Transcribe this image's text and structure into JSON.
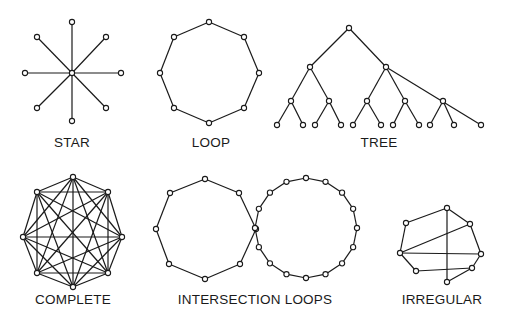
{
  "colors": {
    "ink": "#1a1a1a",
    "background": "#ffffff"
  },
  "diagrams": [
    {
      "key": "star",
      "label": "STAR",
      "label_pos": [
        72,
        135
      ],
      "nodes": [
        [
          72,
          73
        ],
        [
          72,
          22
        ],
        [
          106,
          37
        ],
        [
          121,
          73
        ],
        [
          106,
          108
        ],
        [
          72,
          121
        ],
        [
          37,
          108
        ],
        [
          25,
          73
        ],
        [
          37,
          37
        ]
      ],
      "edges": [
        [
          0,
          1
        ],
        [
          0,
          2
        ],
        [
          0,
          3
        ],
        [
          0,
          4
        ],
        [
          0,
          5
        ],
        [
          0,
          6
        ],
        [
          0,
          7
        ],
        [
          0,
          8
        ]
      ]
    },
    {
      "key": "loop",
      "label": "LOOP",
      "label_pos": [
        211,
        135
      ],
      "nodes": [
        [
          209,
          22
        ],
        [
          244,
          37
        ],
        [
          259,
          73
        ],
        [
          244,
          108
        ],
        [
          209,
          123
        ],
        [
          174,
          108
        ],
        [
          160,
          73
        ],
        [
          174,
          37
        ]
      ],
      "edges": [
        [
          0,
          1
        ],
        [
          1,
          2
        ],
        [
          2,
          3
        ],
        [
          3,
          4
        ],
        [
          4,
          5
        ],
        [
          5,
          6
        ],
        [
          6,
          7
        ],
        [
          7,
          0
        ]
      ]
    },
    {
      "key": "tree",
      "label": "TREE",
      "label_pos": [
        379,
        135
      ],
      "nodes": [
        [
          349,
          28
        ],
        [
          310,
          67
        ],
        [
          386,
          67
        ],
        [
          291,
          101
        ],
        [
          329,
          101
        ],
        [
          367,
          101
        ],
        [
          405,
          101
        ],
        [
          443,
          101
        ],
        [
          277,
          125
        ],
        [
          303,
          125
        ],
        [
          315,
          125
        ],
        [
          341,
          125
        ],
        [
          353,
          125
        ],
        [
          381,
          125
        ],
        [
          393,
          125
        ],
        [
          419,
          125
        ],
        [
          430,
          125
        ],
        [
          454,
          125
        ],
        [
          481,
          125
        ]
      ],
      "edges": [
        [
          0,
          1
        ],
        [
          0,
          2
        ],
        [
          1,
          3
        ],
        [
          1,
          4
        ],
        [
          2,
          5
        ],
        [
          2,
          6
        ],
        [
          2,
          18
        ],
        [
          3,
          8
        ],
        [
          3,
          9
        ],
        [
          4,
          10
        ],
        [
          4,
          11
        ],
        [
          5,
          12
        ],
        [
          5,
          13
        ],
        [
          6,
          14
        ],
        [
          6,
          15
        ],
        [
          7,
          16
        ],
        [
          7,
          17
        ]
      ]
    },
    {
      "key": "complete",
      "label": "COMPLETE",
      "label_pos": [
        73,
        292
      ],
      "nodes": [
        [
          73,
          177
        ],
        [
          108,
          192
        ],
        [
          122,
          237
        ],
        [
          108,
          273
        ],
        [
          73,
          287
        ],
        [
          37,
          273
        ],
        [
          23,
          237
        ],
        [
          37,
          192
        ]
      ],
      "complete": true
    },
    {
      "key": "intersection_loops",
      "label": "INTERSECTION LOOPS",
      "label_pos": [
        255,
        292
      ],
      "nodes": [
        [
          205,
          179
        ],
        [
          239,
          193
        ],
        [
          256,
          229
        ],
        [
          240,
          264
        ],
        [
          205,
          279
        ],
        [
          169,
          264
        ],
        [
          156,
          229
        ],
        [
          170,
          193
        ]
      ],
      "edges": [
        [
          0,
          1
        ],
        [
          1,
          2
        ],
        [
          2,
          3
        ],
        [
          3,
          4
        ],
        [
          4,
          5
        ],
        [
          5,
          6
        ],
        [
          6,
          7
        ],
        [
          7,
          0
        ]
      ],
      "ring": {
        "cx": 306,
        "cy": 228,
        "rx": 51,
        "ry": 50,
        "count": 16,
        "start_deg": 180
      }
    },
    {
      "key": "irregular",
      "label": "IRREGULAR",
      "label_pos": [
        442,
        292
      ],
      "nodes": [
        [
          406,
          223
        ],
        [
          447,
          208
        ],
        [
          470,
          224
        ],
        [
          481,
          254
        ],
        [
          472,
          268
        ],
        [
          447,
          282
        ],
        [
          416,
          271
        ],
        [
          400,
          253
        ]
      ],
      "edges": [
        [
          7,
          0
        ],
        [
          0,
          1
        ],
        [
          1,
          2
        ],
        [
          2,
          3
        ],
        [
          3,
          4
        ],
        [
          4,
          5
        ],
        [
          1,
          5
        ],
        [
          7,
          2
        ],
        [
          7,
          3
        ],
        [
          7,
          6
        ],
        [
          6,
          4
        ]
      ]
    }
  ]
}
